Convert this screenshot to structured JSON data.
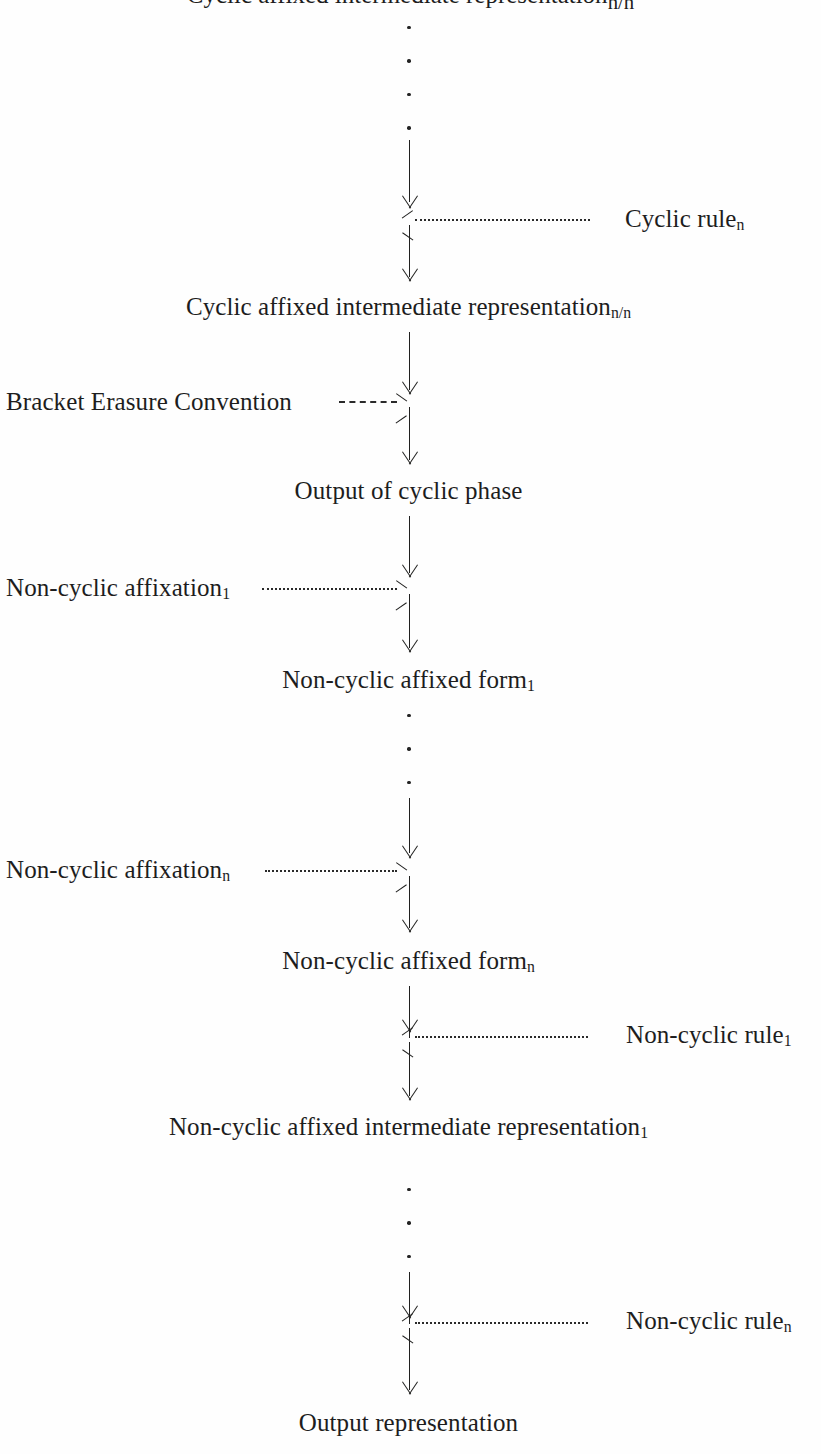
{
  "diagram": {
    "type": "flowchart",
    "orientation": "vertical",
    "title_visible": false,
    "spine_x": 409,
    "nodes": [
      {
        "id": "clipped-top-node",
        "label": "Cyclic affixed intermediate representation",
        "subscript": "n/n",
        "note": "clipped at top edge of page, only descenders visible"
      },
      {
        "id": "cyclic-affixed-intermediate-representation",
        "label": "Cyclic affixed intermediate representation",
        "subscript": "n/n"
      },
      {
        "id": "output-of-cyclic-phase",
        "label": "Output of cyclic phase",
        "subscript": ""
      },
      {
        "id": "non-cyclic-affixed-form-1",
        "label": "Non-cyclic affixed form",
        "subscript": "1"
      },
      {
        "id": "non-cyclic-affixed-form-n",
        "label": "Non-cyclic affixed form",
        "subscript": "n"
      },
      {
        "id": "non-cyclic-affixed-intermediate-representation-1",
        "label": "Non-cyclic affixed intermediate representation",
        "subscript": "1"
      },
      {
        "id": "output-representation",
        "label": "Output representation",
        "subscript": ""
      }
    ],
    "side_labels": [
      {
        "id": "cyclic-rule-n",
        "label": "Cyclic rule",
        "subscript": "n",
        "side": "right",
        "connector": "dotted",
        "arrow_direction": "left"
      },
      {
        "id": "bracket-erasure-convention",
        "label": "Bracket Erasure Convention",
        "subscript": "",
        "side": "left",
        "connector": "dashed",
        "arrow_direction": "right"
      },
      {
        "id": "non-cyclic-affixation-1",
        "label": "Non-cyclic affixation",
        "subscript": "1",
        "side": "left",
        "connector": "dotted",
        "arrow_direction": "right"
      },
      {
        "id": "non-cyclic-affixation-n",
        "label": "Non-cyclic affixation",
        "subscript": "n",
        "side": "left",
        "connector": "dotted",
        "arrow_direction": "right"
      },
      {
        "id": "non-cyclic-rule-1",
        "label": "Non-cyclic rule",
        "subscript": "1",
        "side": "right",
        "connector": "dotted",
        "arrow_direction": "left"
      },
      {
        "id": "non-cyclic-rule-n",
        "label": "Non-cyclic rule",
        "subscript": "n",
        "side": "right",
        "connector": "dotted",
        "arrow_direction": "left"
      }
    ],
    "ellipses": [
      {
        "id": "ellipsis-top",
        "dots": 4
      },
      {
        "id": "ellipsis-middle",
        "dots": 3
      },
      {
        "id": "ellipsis-bottom",
        "dots": 3
      }
    ],
    "colors": {
      "background": "#fefefe",
      "ink": "#1d1d1d",
      "line": "#20201f"
    }
  }
}
